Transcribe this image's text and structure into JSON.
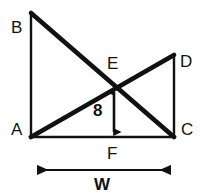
{
  "figure": {
    "kind": "geometry-diagram",
    "stroke_color": "#111111",
    "background_color": "#ffffff",
    "vertices": [
      {
        "id": "B",
        "label": "B",
        "x": 31,
        "y": 13,
        "label_x": 11,
        "label_y": 19
      },
      {
        "id": "A",
        "label": "A",
        "x": 31,
        "y": 137,
        "label_x": 11,
        "label_y": 121
      },
      {
        "id": "D",
        "label": "D",
        "x": 174,
        "y": 55,
        "label_x": 180,
        "label_y": 53
      },
      {
        "id": "C",
        "label": "C",
        "x": 174,
        "y": 137,
        "label_x": 181,
        "label_y": 121
      },
      {
        "id": "E",
        "label": "E",
        "x": 114,
        "y": 87,
        "label_x": 107,
        "label_y": 55
      },
      {
        "id": "F",
        "label": "F",
        "x": 114,
        "y": 137,
        "label_x": 107,
        "label_y": 145
      }
    ],
    "segments": [
      {
        "id": "AB",
        "from": "A",
        "to": "B",
        "width": 2
      },
      {
        "id": "BC",
        "from": "B",
        "to": "C",
        "width": 4
      },
      {
        "id": "AD",
        "from": "A",
        "to": "D",
        "width": 4
      },
      {
        "id": "DC",
        "from": "D",
        "to": "C",
        "width": 2
      },
      {
        "id": "AC",
        "from": "A",
        "to": "C",
        "width": 2
      }
    ],
    "dimensions": [
      {
        "id": "height",
        "label": "8",
        "orientation": "vertical",
        "x": 114,
        "y_start": 87,
        "y_end": 137,
        "label_x": 93,
        "label_y": 102
      },
      {
        "id": "width",
        "label": "W",
        "orientation": "horizontal",
        "y": 170,
        "x_start": 27,
        "x_end": 180,
        "label_x": 94,
        "label_y": 176
      }
    ]
  }
}
